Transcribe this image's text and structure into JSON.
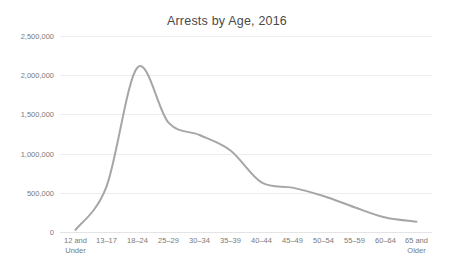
{
  "chart_data": {
    "type": "line",
    "title": "Arrests by Age, 2016",
    "xlabel": "",
    "ylabel": "",
    "categories": [
      "12 and\nUnder",
      "13–17",
      "18–24",
      "25–29",
      "30–34",
      "35–39",
      "40–44",
      "45–49",
      "50–54",
      "55–59",
      "60–64",
      "65 and\nOlder"
    ],
    "values": [
      26000,
      579000,
      2099000,
      1395000,
      1237000,
      1040000,
      632000,
      566000,
      460000,
      316000,
      184000,
      132000
    ],
    "ylim": [
      0,
      2500000
    ],
    "yticks": [
      0,
      500000,
      1000000,
      1500000,
      2000000,
      2500000
    ],
    "ytick_labels": [
      "0",
      "500,000",
      "1,000,000",
      "1,500,000",
      "2,000,000",
      "2,500,000"
    ],
    "grid": "horizontal",
    "legend": "none",
    "smoothing": "spline",
    "line_color": "#a6a6a6",
    "line_width": 2,
    "grid_color": "#ededed",
    "background": "#ffffff",
    "title_color": "#4a4a4a",
    "tick_color": "#7a7a7a"
  }
}
